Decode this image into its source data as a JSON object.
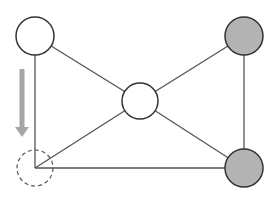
{
  "diagram": {
    "type": "graph",
    "colors": {
      "edge": "#555555",
      "node_stroke": "#333333",
      "white_fill": "#ffffff",
      "gray_fill": "#b3b3b3",
      "arrow": "#a6a6a6",
      "dashed_stroke": "#555555"
    },
    "nodes": [
      {
        "id": "top-left",
        "cx": 35,
        "cy": 36,
        "r": 19,
        "fill": "white",
        "style": "solid"
      },
      {
        "id": "center",
        "cx": 140,
        "cy": 101,
        "r": 18,
        "fill": "white",
        "style": "solid"
      },
      {
        "id": "top-right",
        "cx": 244,
        "cy": 36,
        "r": 19,
        "fill": "gray",
        "style": "solid"
      },
      {
        "id": "bottom-right",
        "cx": 244,
        "cy": 168,
        "r": 19,
        "fill": "gray",
        "style": "solid"
      },
      {
        "id": "bottom-left",
        "cx": 35,
        "cy": 168,
        "r": 18,
        "fill": "none",
        "style": "dashed"
      }
    ],
    "edges": [
      {
        "from": "top-left",
        "to": "center"
      },
      {
        "from": "top-left",
        "to": "bottom-left"
      },
      {
        "from": "center",
        "to": "top-right"
      },
      {
        "from": "center",
        "to": "bottom-right"
      },
      {
        "from": "center",
        "to": "bottom-left"
      },
      {
        "from": "top-right",
        "to": "bottom-right"
      },
      {
        "from": "bottom-left",
        "to": "bottom-right"
      }
    ],
    "arrow": {
      "x": 22,
      "y_start": 69,
      "y_end": 137,
      "direction": "down"
    }
  }
}
